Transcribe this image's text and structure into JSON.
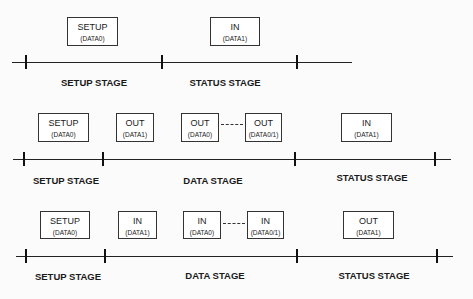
{
  "rows": [
    {
      "name": "no-data-transfer",
      "packets": [
        {
          "pid": "SETUP",
          "data": "(DATA0)"
        },
        {
          "pid": "IN",
          "data": "(DATA1)"
        }
      ],
      "stages": [
        "SETUP STAGE",
        "STATUS STAGE"
      ]
    },
    {
      "name": "control-write",
      "packets": [
        {
          "pid": "SETUP",
          "data": "(DATA0)"
        },
        {
          "pid": "OUT",
          "data": "(DATA1)"
        },
        {
          "pid": "OUT",
          "data": "(DATA0)"
        },
        {
          "pid": "OUT",
          "data": "(DATA0/1)"
        },
        {
          "pid": "IN",
          "data": "(DATA1)"
        }
      ],
      "stages": [
        "SETUP STAGE",
        "DATA STAGE",
        "STATUS STAGE"
      ]
    },
    {
      "name": "control-read",
      "packets": [
        {
          "pid": "SETUP",
          "data": "(DATA0)"
        },
        {
          "pid": "IN",
          "data": "(DATA1)"
        },
        {
          "pid": "IN",
          "data": "(DATA0)"
        },
        {
          "pid": "IN",
          "data": "(DATA0/1)"
        },
        {
          "pid": "OUT",
          "data": "(DATA1)"
        }
      ],
      "stages": [
        "SETUP STAGE",
        "DATA STAGE",
        "STATUS STAGE"
      ]
    }
  ]
}
